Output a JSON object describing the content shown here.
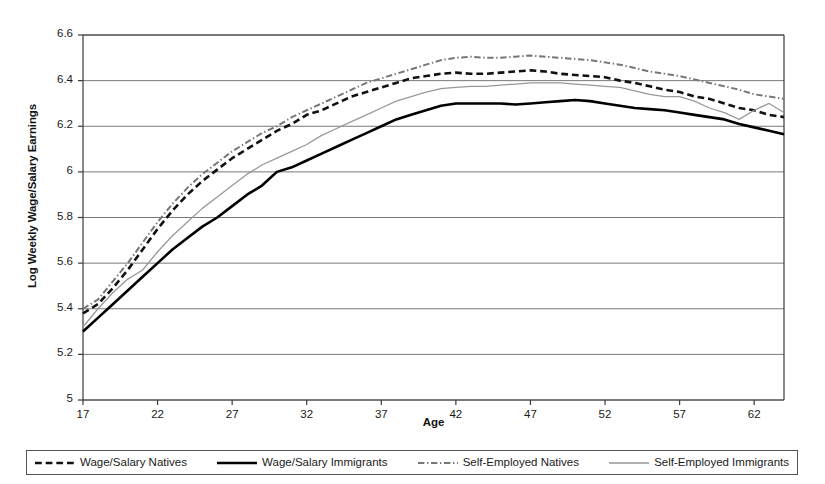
{
  "chart_data": {
    "type": "line",
    "title": "",
    "xlabel": "Age",
    "ylabel": "Log Weekly Wage/Salary Earnings",
    "xlim": [
      17,
      64
    ],
    "ylim": [
      5,
      6.6
    ],
    "xticks": [
      17,
      22,
      27,
      32,
      37,
      42,
      47,
      52,
      57,
      62
    ],
    "yticks": [
      "5",
      "5.2",
      "5.4",
      "5.6",
      "5.8",
      "6",
      "6.2",
      "6.4",
      "6.6"
    ],
    "grid": "horizontal",
    "legend_position": "bottom",
    "x": [
      17,
      18,
      19,
      20,
      21,
      22,
      23,
      24,
      25,
      26,
      27,
      28,
      29,
      30,
      31,
      32,
      33,
      34,
      35,
      36,
      37,
      38,
      39,
      40,
      41,
      42,
      43,
      44,
      45,
      46,
      47,
      48,
      49,
      50,
      51,
      52,
      53,
      54,
      55,
      56,
      57,
      58,
      59,
      60,
      61,
      62,
      63,
      64
    ],
    "series": [
      {
        "name": "Wage/Salary Natives",
        "style": "dashed",
        "color": "#111111",
        "width": 2.6,
        "values": [
          5.38,
          5.42,
          5.49,
          5.57,
          5.66,
          5.75,
          5.83,
          5.9,
          5.96,
          6.01,
          6.06,
          6.1,
          6.14,
          6.18,
          6.21,
          6.25,
          6.27,
          6.3,
          6.33,
          6.35,
          6.37,
          6.39,
          6.41,
          6.42,
          6.43,
          6.435,
          6.43,
          6.43,
          6.435,
          6.44,
          6.445,
          6.44,
          6.43,
          6.425,
          6.42,
          6.415,
          6.4,
          6.39,
          6.375,
          6.36,
          6.35,
          6.33,
          6.32,
          6.3,
          6.28,
          6.27,
          6.25,
          6.24
        ]
      },
      {
        "name": "Wage/Salary Immigrants",
        "style": "solid",
        "color": "#000000",
        "width": 2.6,
        "values": [
          5.3,
          5.36,
          5.42,
          5.48,
          5.54,
          5.6,
          5.66,
          5.71,
          5.76,
          5.8,
          5.85,
          5.9,
          5.94,
          6.0,
          6.02,
          6.05,
          6.08,
          6.11,
          6.14,
          6.17,
          6.2,
          6.23,
          6.25,
          6.27,
          6.29,
          6.3,
          6.3,
          6.3,
          6.3,
          6.295,
          6.3,
          6.305,
          6.31,
          6.315,
          6.31,
          6.3,
          6.29,
          6.28,
          6.275,
          6.27,
          6.26,
          6.25,
          6.24,
          6.23,
          6.21,
          6.195,
          6.18,
          6.165
        ]
      },
      {
        "name": "Self-Employed Natives",
        "style": "dash-dot",
        "color": "#777777",
        "width": 2.0,
        "values": [
          5.4,
          5.44,
          5.52,
          5.6,
          5.69,
          5.78,
          5.86,
          5.93,
          5.99,
          6.04,
          6.09,
          6.13,
          6.17,
          6.2,
          6.24,
          6.27,
          6.3,
          6.33,
          6.36,
          6.39,
          6.41,
          6.43,
          6.45,
          6.47,
          6.49,
          6.5,
          6.505,
          6.5,
          6.5,
          6.505,
          6.51,
          6.505,
          6.5,
          6.495,
          6.49,
          6.48,
          6.47,
          6.455,
          6.44,
          6.43,
          6.42,
          6.405,
          6.39,
          6.375,
          6.36,
          6.34,
          6.33,
          6.32
        ]
      },
      {
        "name": "Self-Employed Immigrants",
        "style": "thin-solid",
        "color": "#999999",
        "width": 1.3,
        "values": [
          5.32,
          5.4,
          5.47,
          5.53,
          5.57,
          5.65,
          5.72,
          5.78,
          5.84,
          5.89,
          5.94,
          5.99,
          6.03,
          6.06,
          6.09,
          6.12,
          6.16,
          6.19,
          6.22,
          6.25,
          6.28,
          6.31,
          6.33,
          6.35,
          6.365,
          6.37,
          6.375,
          6.375,
          6.38,
          6.385,
          6.39,
          6.39,
          6.39,
          6.385,
          6.38,
          6.375,
          6.37,
          6.355,
          6.34,
          6.33,
          6.33,
          6.31,
          6.28,
          6.26,
          6.23,
          6.27,
          6.3,
          6.26
        ]
      }
    ]
  },
  "axis": {
    "y_title": "Log Weekly Wage/Salary Earnings",
    "x_title": "Age"
  },
  "legend": {
    "entries": [
      {
        "label": "Wage/Salary Natives"
      },
      {
        "label": "Wage/Salary Immigrants"
      },
      {
        "label": "Self-Employed Natives"
      },
      {
        "label": "Self-Employed Immigrants"
      }
    ]
  },
  "colors": {
    "wage_natives": "#111111",
    "wage_immigrants": "#000000",
    "self_natives": "#777777",
    "self_immigrants": "#999999",
    "grid": "#6a6a6a",
    "axis": "#3a3a3a",
    "background": "#ffffff"
  }
}
